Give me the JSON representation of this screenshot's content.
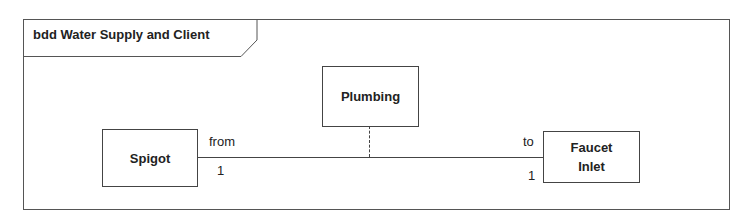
{
  "diagram": {
    "frame_title": "bdd Water Supply and Client",
    "blocks": {
      "spigot": "Spigot",
      "plumbing": "Plumbing",
      "faucet_inlet_line1": "Faucet",
      "faucet_inlet_line2": "Inlet"
    },
    "association": {
      "from_role": "from",
      "from_multiplicity": "1",
      "to_role": "to",
      "to_multiplicity": "1"
    }
  }
}
